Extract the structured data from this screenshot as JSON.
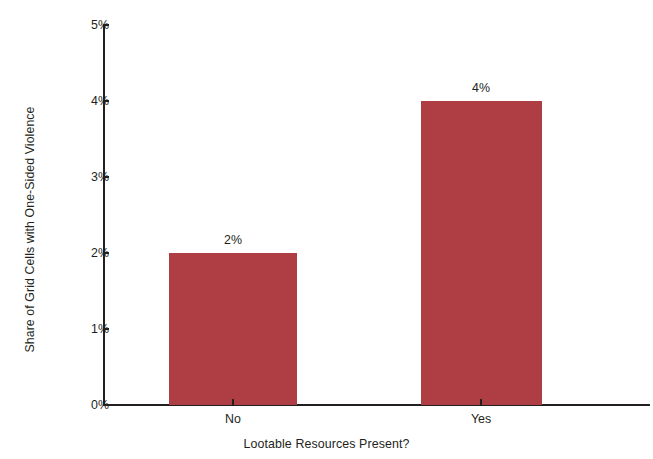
{
  "chart_data": {
    "type": "bar",
    "title": "",
    "subtitle": "",
    "xlabel": "Lootable Resources Present?",
    "ylabel": "Share of Grid Cells with One-Sided Violence",
    "categories": [
      "No",
      "Yes"
    ],
    "values": [
      2,
      4
    ],
    "value_labels": [
      "2%",
      "4%"
    ],
    "ylim": [
      0,
      5
    ],
    "ytick_values": [
      0,
      1,
      2,
      3,
      4,
      5
    ],
    "ytick_labels": [
      "0%",
      "1%",
      "2%",
      "3%",
      "4%",
      "5%"
    ],
    "grid": false,
    "legend": null,
    "legend_position": "none",
    "bar_color": "#ae3e44",
    "axis_color": "#231f20",
    "background_color": "#ffffff"
  }
}
